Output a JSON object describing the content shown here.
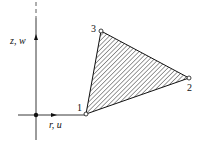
{
  "axes": {
    "vertical_label": "z, w",
    "horizontal_label": "r, u"
  },
  "nodes": [
    {
      "id": "1",
      "label": "1",
      "x": 86,
      "y": 114
    },
    {
      "id": "2",
      "label": "2",
      "x": 189,
      "y": 78
    },
    {
      "id": "3",
      "label": "3",
      "x": 101,
      "y": 31
    }
  ],
  "element": {
    "type": "triangular element",
    "fill": "hatched"
  },
  "colors": {
    "line": "#111111",
    "background": "#ffffff"
  }
}
